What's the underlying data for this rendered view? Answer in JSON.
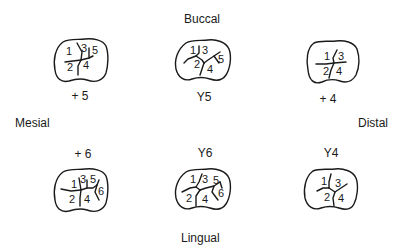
{
  "orientation": {
    "top": "Buccal",
    "bottom": "Lingual",
    "left": "Mesial",
    "right": "Distal"
  },
  "teeth": [
    {
      "id": "plus5",
      "caption": "+ 5",
      "cusps": [
        "1",
        "2",
        "3",
        "4",
        "5"
      ]
    },
    {
      "id": "y5",
      "caption": "Y5",
      "cusps": [
        "1",
        "2",
        "3",
        "4",
        "5"
      ]
    },
    {
      "id": "plus4",
      "caption": "+ 4",
      "cusps": [
        "1",
        "2",
        "3",
        "4"
      ]
    },
    {
      "id": "plus6",
      "caption": "+ 6",
      "cusps": [
        "1",
        "2",
        "3",
        "4",
        "5",
        "6"
      ]
    },
    {
      "id": "y6",
      "caption": "Y6",
      "cusps": [
        "1",
        "2",
        "3",
        "4",
        "5",
        "6"
      ]
    },
    {
      "id": "y4",
      "caption": "Y4",
      "cusps": [
        "1",
        "2",
        "3",
        "4"
      ]
    }
  ]
}
